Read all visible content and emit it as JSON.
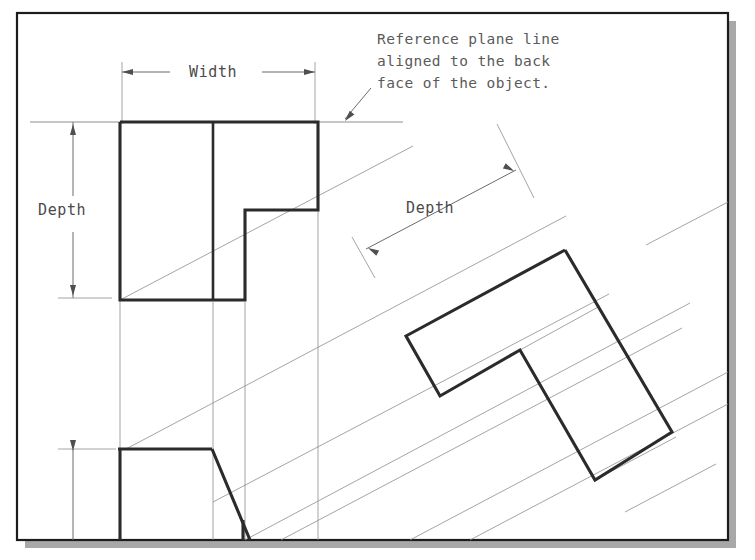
{
  "canvas": {
    "width": 755,
    "height": 560,
    "background": "#ffffff"
  },
  "frame": {
    "name": "drawing-border",
    "x": 17,
    "y": 13,
    "width": 711,
    "height": 527,
    "stroke": "#1c1c1c",
    "stroke_width": 2.2,
    "fill": "#ffffff",
    "shadow_color": "#a8a8a8",
    "shadow_offset": 8
  },
  "styles": {
    "object_line_color": "#2b2b2b",
    "object_line_width": 3.1,
    "thin_line_color": "#8d8d8d",
    "thin_line_width": 0.8,
    "dim_line_color": "#6b6b6b",
    "dim_line_width": 0.9,
    "text_color": "#4a4a4a"
  },
  "annotations": {
    "note": {
      "name": "reference-plane-note",
      "lines": [
        "Reference plane line",
        "aligned to the back",
        "face of the object."
      ],
      "x": 377,
      "y": 44,
      "line_height": 22
    },
    "width_label": {
      "name": "width-dimension-label",
      "text": "Width",
      "x": 189,
      "y": 77
    },
    "depth_label_top": {
      "name": "depth-dimension-label-front-view",
      "text": "Depth",
      "x": 38,
      "y": 215
    },
    "depth_label_oblique": {
      "name": "depth-dimension-label-oblique-view",
      "text": "Depth",
      "x": 406,
      "y": 213
    }
  },
  "reference_plane": {
    "name": "reference-plane-line",
    "x1": 30,
    "y1": 122,
    "x2": 403,
    "y2": 122
  },
  "leader": {
    "name": "reference-plane-leader",
    "points": "371,88 345,119",
    "arrow_x": 345,
    "arrow_y": 121,
    "arrow_angle": 130
  },
  "top_view": {
    "name": "top-view-outline",
    "outline": "120,122 318,122 318,210 245,210 245,300 120,300 120,122",
    "interior_line": {
      "x1": 213,
      "y1": 122,
      "x2": 213,
      "y2": 300
    }
  },
  "front_view": {
    "name": "front-view-outline",
    "top_edge": {
      "x1": 118,
      "y1": 449,
      "x2": 212,
      "y2": 449
    },
    "left_edge": {
      "x1": 120,
      "y1": 449,
      "x2": 120,
      "y2": 540
    },
    "slant_edge": {
      "x1": 212,
      "y1": 449,
      "x2": 250,
      "y2": 540
    },
    "inner_edge": {
      "x1": 243,
      "y1": 520,
      "x2": 243,
      "y2": 540
    }
  },
  "oblique_view": {
    "name": "oblique-view-outline",
    "outline": "565,250 672,432 595,480 520,350 440,396 406,336 565,250",
    "thin_back_edges": [
      {
        "x1": 406,
        "y1": 336,
        "x2": 552,
        "y2": 258
      },
      {
        "x1": 520,
        "y1": 350,
        "x2": 600,
        "y2": 306
      },
      {
        "x1": 595,
        "y1": 480,
        "x2": 676,
        "y2": 437
      }
    ]
  },
  "width_dimension": {
    "name": "width-dimension",
    "line": {
      "x1": 122,
      "y1": 72,
      "x2": 315,
      "y2": 72
    },
    "left_arrow": {
      "x": 122,
      "y": 72
    },
    "right_arrow": {
      "x": 315,
      "y": 72
    },
    "ext_left": {
      "x1": 122,
      "y1": 62,
      "x2": 122,
      "y2": 124
    },
    "ext_right": {
      "x1": 315,
      "y1": 62,
      "x2": 315,
      "y2": 124
    },
    "gap_start": 170,
    "gap_end": 262
  },
  "depth_dimension_vertical": {
    "name": "depth-dimension-vertical",
    "line": {
      "x1": 73,
      "y1": 122,
      "x2": 73,
      "y2": 298
    },
    "top_arrow": {
      "x": 73,
      "y": 124
    },
    "bottom_arrow": {
      "x": 73,
      "y": 296
    },
    "gap_start": 196,
    "gap_end": 232,
    "ext_bottom": {
      "x1": 58,
      "y1": 298,
      "x2": 112,
      "y2": 298
    }
  },
  "height_dimension": {
    "name": "height-dimension-front-view",
    "line": {
      "x1": 73,
      "y1": 449,
      "x2": 73,
      "y2": 540
    },
    "top_arrow": {
      "x": 73,
      "y": 451
    },
    "ext_top": {
      "x1": 58,
      "y1": 449,
      "x2": 116,
      "y2": 449
    }
  },
  "depth_dimension_oblique": {
    "name": "depth-dimension-oblique",
    "line": {
      "x1": 366,
      "y1": 249,
      "x2": 516,
      "y2": 170
    },
    "start_arrow": {
      "x": 368,
      "y": 248,
      "angle": 208
    },
    "end_arrow": {
      "x": 514,
      "y": 171,
      "angle": 28
    },
    "ext_low": {
      "x1": 352,
      "y1": 237,
      "x2": 375,
      "y2": 278
    },
    "ext_high": {
      "x1": 497,
      "y1": 124,
      "x2": 534,
      "y2": 198
    }
  },
  "projection_lines": {
    "name": "projection-lines",
    "vertical": [
      {
        "x1": 120,
        "y1": 124,
        "x2": 120,
        "y2": 300
      },
      {
        "x1": 120,
        "y1": 300,
        "x2": 120,
        "y2": 450
      },
      {
        "x1": 213,
        "y1": 302,
        "x2": 213,
        "y2": 540
      },
      {
        "x1": 245,
        "y1": 302,
        "x2": 245,
        "y2": 540
      },
      {
        "x1": 318,
        "y1": 124,
        "x2": 318,
        "y2": 540
      }
    ],
    "inclined": [
      {
        "x1": 120,
        "y1": 300,
        "x2": 413,
        "y2": 146
      },
      {
        "x1": 126,
        "y1": 449,
        "x2": 566,
        "y2": 216
      },
      {
        "x1": 213,
        "y1": 502,
        "x2": 609,
        "y2": 294
      },
      {
        "x1": 245,
        "y1": 540,
        "x2": 690,
        "y2": 303
      },
      {
        "x1": 281,
        "y1": 540,
        "x2": 682,
        "y2": 328
      },
      {
        "x1": 410,
        "y1": 540,
        "x2": 728,
        "y2": 372
      },
      {
        "x1": 470,
        "y1": 540,
        "x2": 728,
        "y2": 404
      },
      {
        "x1": 646,
        "y1": 245,
        "x2": 728,
        "y2": 202
      },
      {
        "x1": 625,
        "y1": 512,
        "x2": 716,
        "y2": 464
      }
    ]
  },
  "icons": {
    "arrow_marker": "dimension-arrowhead"
  }
}
